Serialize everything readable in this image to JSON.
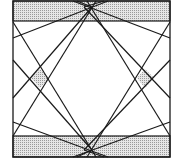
{
  "diagram": {
    "width": 175,
    "height": 168,
    "stroke_color": "#1a1a1a",
    "fill_color": "#d4d4d4",
    "hatch_color": "#9a9a9a",
    "outer_square": {
      "x": 13,
      "y": 1,
      "w": 157,
      "h": 156
    },
    "bands": [
      {
        "name": "top-band",
        "x": 13,
        "y": 1,
        "w": 157,
        "h": 20
      },
      {
        "name": "bottom-band",
        "x": 13,
        "y": 136,
        "w": 157,
        "h": 21
      }
    ],
    "shaded_diamonds": [
      {
        "name": "left-diamond",
        "points": "31,78 40,69 49,78 40,88"
      },
      {
        "name": "right-diamond",
        "points": "137,78 145,69 154,78 145,88"
      }
    ],
    "lines": [
      [
        13,
        38,
        108,
        1
      ],
      [
        170,
        38,
        73,
        1
      ],
      [
        13,
        122,
        108,
        157
      ],
      [
        170,
        122,
        73,
        157
      ],
      [
        13,
        22,
        96,
        157
      ],
      [
        170,
        22,
        87,
        157
      ],
      [
        13,
        136,
        96,
        1
      ],
      [
        170,
        136,
        87,
        1
      ],
      [
        13,
        98,
        92,
        7
      ],
      [
        170,
        98,
        84,
        7
      ],
      [
        13,
        60,
        92,
        150
      ],
      [
        170,
        60,
        84,
        150
      ],
      [
        77,
        1,
        92,
        7
      ],
      [
        104,
        1,
        84,
        7
      ],
      [
        77,
        157,
        92,
        150
      ],
      [
        104,
        157,
        84,
        150
      ]
    ]
  }
}
